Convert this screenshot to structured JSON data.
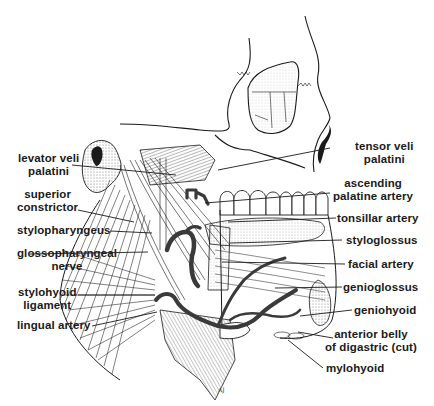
{
  "figure": {
    "signature": "AJ",
    "colors": {
      "ink": "#1a1a1a",
      "artery": "#3a3a3a",
      "stipple": "#c8c8c8",
      "background": "#ffffff"
    }
  },
  "labels_left": [
    {
      "id": "levator-veli-palatini",
      "lines": [
        "levator veli",
        "palatini"
      ]
    },
    {
      "id": "superior-constrictor",
      "lines": [
        "superior",
        "constrictor"
      ]
    },
    {
      "id": "stylopharyngeus",
      "lines": [
        "stylopharyngeus"
      ]
    },
    {
      "id": "glossopharyngeal-nerve",
      "lines": [
        "glossopharyngeal",
        "nerve"
      ]
    },
    {
      "id": "stylohyoid-ligament",
      "lines": [
        "stylohyoid",
        "ligament"
      ]
    },
    {
      "id": "lingual-artery",
      "lines": [
        "lingual artery"
      ]
    }
  ],
  "labels_right": [
    {
      "id": "tensor-veli-palatini",
      "lines": [
        "tensor veli",
        "palatini"
      ]
    },
    {
      "id": "ascending-palatine-artery",
      "lines": [
        "ascending",
        "palatine artery"
      ]
    },
    {
      "id": "tonsillar-artery",
      "lines": [
        "tonsillar artery"
      ]
    },
    {
      "id": "styloglossus",
      "lines": [
        "styloglossus"
      ]
    },
    {
      "id": "facial-artery",
      "lines": [
        "facial artery"
      ]
    },
    {
      "id": "genioglossus",
      "lines": [
        "genioglossus"
      ]
    },
    {
      "id": "geniohyoid",
      "lines": [
        "geniohyoid"
      ]
    },
    {
      "id": "anterior-belly-of-digastric",
      "lines": [
        "anterior belly",
        "of digastric (cut)"
      ]
    },
    {
      "id": "mylohyoid",
      "lines": [
        "mylohyoid"
      ]
    }
  ]
}
